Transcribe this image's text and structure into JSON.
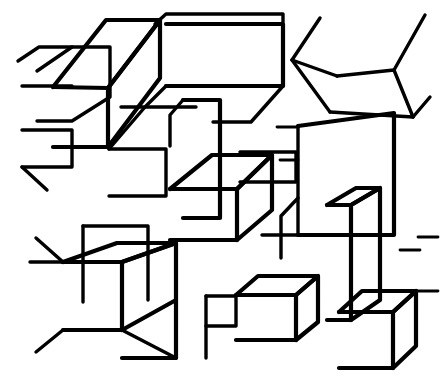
{
  "artwork": {
    "title": "Abstract Stacked Boxes Line Drawing",
    "description": "Black-outline line art of many overlapping rectangular boxes drawn in oblique/isometric projection on a white background",
    "style": "monochrome line art",
    "medium": "vector outline drawing",
    "background_color": "#ffffff",
    "stroke_color": "#000000",
    "canvas": {
      "width": 440,
      "height": 391
    },
    "stroke_widths": {
      "thick": 4.2,
      "medium": 3.4,
      "thin": 2.8
    },
    "subject_count": 22,
    "projection": "oblique parallel projection",
    "alt_text": "A dense cluster of outlined three-dimensional boxes of varying sizes overlapping each other, filling a square frame with white interiors and black edges."
  },
  "shapes": [
    {
      "name": "top-left-tall-box",
      "points": "37,71 72,47 110,47 110,97 72,121 37,121",
      "width": 3.4
    },
    {
      "name": "top-left-large-box-top-face",
      "points": "53,87 106,20 160,20 108,88",
      "width": 4.2
    },
    {
      "name": "top-left-large-box-front-face",
      "points": "53,87 108,88 108,147 53,147",
      "width": 4.2
    },
    {
      "name": "top-left-large-box-right-face",
      "points": "108,88 160,20 160,78 108,147",
      "width": 4.2
    },
    {
      "name": "upper-mid-long-slab-top",
      "points": "155,24 166,14 283,14 283,22",
      "width": 3.4
    },
    {
      "name": "upper-mid-long-slab-body",
      "points": "166,24 283,24 283,86 166,86",
      "width": 4.2
    },
    {
      "name": "upper-mid-slab-bottom-bevel",
      "points": "166,86 145,107 121,107",
      "width": 3.4
    },
    {
      "name": "upper-mid-slab-right-bevel",
      "points": "283,86 251,122 213,122",
      "width": 3.4
    },
    {
      "name": "left-stub-upper",
      "points": "18,61 39,47 72,47",
      "width": 3.4
    },
    {
      "name": "left-stub-lower",
      "points": "22,86 72,86",
      "width": 3.4
    },
    {
      "name": "left-mid-wedge",
      "points": "22,130 72,130 72,167 22,167",
      "width": 3.4
    },
    {
      "name": "left-mid-wedge-diagonal",
      "points": "22,167 47,190",
      "width": 3.4
    },
    {
      "name": "top-right-chevron-upper-left",
      "points": "320,18 292,60",
      "width": 3.4
    },
    {
      "name": "top-right-chevron-apex",
      "points": "292,60 337,76",
      "width": 3.4
    },
    {
      "name": "top-right-chevron-upper-right",
      "points": "425,15 394,70",
      "width": 3.4
    },
    {
      "name": "top-right-face-lower",
      "points": "337,76 394,70 413,117",
      "width": 3.4
    },
    {
      "name": "top-right-face-left",
      "points": "292,60 330,112",
      "width": 3.4
    },
    {
      "name": "top-right-face-bottom",
      "points": "330,112 413,117",
      "width": 3.4
    },
    {
      "name": "top-right-tail",
      "points": "413,117 430,97",
      "width": 3.4
    },
    {
      "name": "center-tall-pillar",
      "points": "183,100 220,100 220,218 183,218",
      "width": 4.2
    },
    {
      "name": "center-pillar-top-bevel",
      "points": "183,100 170,115 170,146",
      "width": 3.4
    },
    {
      "name": "mid-left-plate-top",
      "points": "109,149 145,107 196,107",
      "width": 3.4
    },
    {
      "name": "mid-left-plate-body",
      "points": "109,149 166,149 166,196 109,196",
      "width": 3.4
    },
    {
      "name": "center-cube-top",
      "points": "170,189 212,155 272,155 237,189",
      "width": 4.2
    },
    {
      "name": "center-cube-front",
      "points": "170,189 237,189 237,240 170,240",
      "width": 4.2
    },
    {
      "name": "center-cube-right",
      "points": "237,189 272,155 272,210 237,240",
      "width": 4.2
    },
    {
      "name": "right-big-panel",
      "points": "298,126 394,113 394,235 298,235",
      "width": 4.2
    },
    {
      "name": "right-big-panel-left-edge",
      "points": "298,126 298,235",
      "width": 3.4
    },
    {
      "name": "right-panel-lower-step",
      "points": "298,198 281,216 281,258",
      "width": 3.4
    },
    {
      "name": "right-panel-baseline",
      "points": "298,235 262,235",
      "width": 3.4
    },
    {
      "name": "right-upper-bar",
      "points": "240,152 296,152 296,182 240,182",
      "width": 3.4
    },
    {
      "name": "right-small-stub-a",
      "points": "277,127 298,127",
      "width": 2.8
    },
    {
      "name": "right-small-stub-b",
      "points": "280,160 298,160",
      "width": 2.8
    },
    {
      "name": "lower-left-big-cube-top",
      "points": "63,262 117,243 176,243 122,262",
      "width": 4.2
    },
    {
      "name": "lower-left-big-cube-front",
      "points": "63,262 122,262 122,330 63,330",
      "width": 4.2
    },
    {
      "name": "lower-left-cube-left-tip",
      "points": "63,262 30,262",
      "width": 3.4
    },
    {
      "name": "lower-left-cube-topleft-tip",
      "points": "63,262 36,238",
      "width": 3.4
    },
    {
      "name": "lower-left-cube-bottom-tip",
      "points": "63,330 36,352",
      "width": 3.4
    },
    {
      "name": "lower-center-cube-top",
      "points": "122,262 176,243 176,300",
      "width": 4.2
    },
    {
      "name": "lower-center-cube-front",
      "points": "122,330 176,300 176,358 122,358",
      "width": 4.2
    },
    {
      "name": "lower-center-cube-right",
      "points": "176,300 176,358",
      "width": 3.4
    },
    {
      "name": "lower-center-cube-diagonal",
      "points": "122,330 176,358",
      "width": 3.4
    },
    {
      "name": "bottom-left-vertical",
      "points": "83,226 83,302",
      "width": 3.4
    },
    {
      "name": "bottom-left-slab",
      "points": "83,226 148,226 148,300",
      "width": 3.4
    },
    {
      "name": "bottom-mid-box-top",
      "points": "236,295 258,276 318,276 296,295",
      "width": 4.2
    },
    {
      "name": "bottom-mid-box-front",
      "points": "236,295 296,295 296,340 236,340",
      "width": 4.2
    },
    {
      "name": "bottom-mid-box-right",
      "points": "296,295 318,276 318,322 296,340",
      "width": 4.2
    },
    {
      "name": "bottom-mid-small-step",
      "points": "206,296 236,296 236,326 206,326",
      "width": 3.4
    },
    {
      "name": "bottom-mid-step-stem",
      "points": "206,296 206,358",
      "width": 3.4
    },
    {
      "name": "bottom-right-cube-top",
      "points": "339,312 362,291 416,291 393,312",
      "width": 4.2
    },
    {
      "name": "bottom-right-cube-front",
      "points": "339,312 393,312 393,368 339,368",
      "width": 4.2
    },
    {
      "name": "bottom-right-cube-right",
      "points": "393,312 416,291 416,346 393,368",
      "width": 4.2
    },
    {
      "name": "right-vertical-slab-top",
      "points": "327,205 356,188 380,188 351,205",
      "width": 4.2
    },
    {
      "name": "right-vertical-slab-front",
      "points": "327,205 351,205 351,320 327,320",
      "width": 4.2
    },
    {
      "name": "right-vertical-slab-side",
      "points": "351,205 380,188 380,300 351,320",
      "width": 4.2
    },
    {
      "name": "far-right-edge-a",
      "points": "416,291 438,291",
      "width": 2.8
    },
    {
      "name": "far-right-edge-b",
      "points": "418,237 438,237",
      "width": 2.8
    },
    {
      "name": "far-right-edge-c",
      "points": "400,250 420,250",
      "width": 2.8
    }
  ]
}
